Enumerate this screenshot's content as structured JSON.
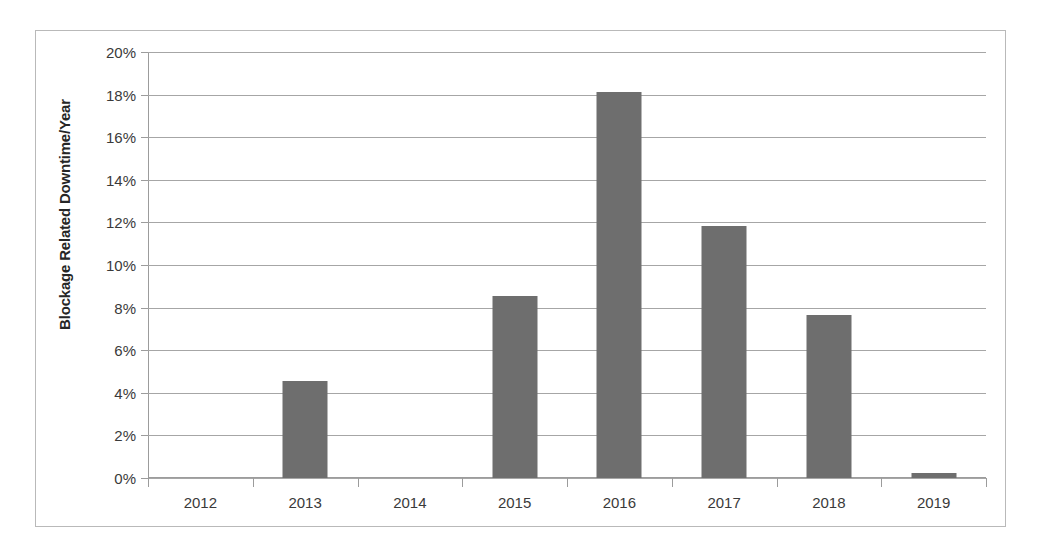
{
  "chart_data": {
    "type": "bar",
    "title": "",
    "xlabel": "",
    "ylabel": "Blockage Related Downtime/Year",
    "categories": [
      "2012",
      "2013",
      "2014",
      "2015",
      "2016",
      "2017",
      "2018",
      "2019"
    ],
    "values": [
      0,
      4.55,
      0,
      8.55,
      18.1,
      11.85,
      7.65,
      0.25
    ],
    "value_unit": "%",
    "ylim": [
      0,
      20
    ],
    "ytick_values": [
      0,
      2,
      4,
      6,
      8,
      10,
      12,
      14,
      16,
      18,
      20
    ],
    "ytick_labels": [
      "0%",
      "2%",
      "4%",
      "6%",
      "8%",
      "10%",
      "12%",
      "14%",
      "16%",
      "18%",
      "20%"
    ],
    "grid": true,
    "legend": "none",
    "bar_color": "#6e6e6e",
    "gridline_color": "#a6a6a6",
    "axis_color": "#9c9c9c",
    "border_color": "#b9b9b9"
  }
}
